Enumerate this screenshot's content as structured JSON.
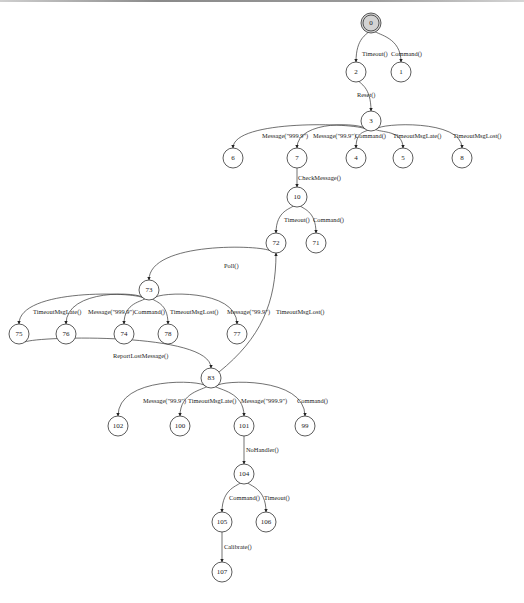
{
  "diagram": {
    "type": "state-transition-tree",
    "nodes": [
      {
        "id": "0",
        "x": 371,
        "y": 23,
        "start": true
      },
      {
        "id": "2",
        "x": 356,
        "y": 72
      },
      {
        "id": "1",
        "x": 401,
        "y": 72
      },
      {
        "id": "3",
        "x": 371,
        "y": 121
      },
      {
        "id": "6",
        "x": 233,
        "y": 158
      },
      {
        "id": "7",
        "x": 297,
        "y": 158
      },
      {
        "id": "4",
        "x": 356,
        "y": 158
      },
      {
        "id": "5",
        "x": 403,
        "y": 158
      },
      {
        "id": "8",
        "x": 462,
        "y": 158
      },
      {
        "id": "10",
        "x": 297,
        "y": 197
      },
      {
        "id": "72",
        "x": 276,
        "y": 243
      },
      {
        "id": "71",
        "x": 316,
        "y": 243
      },
      {
        "id": "73",
        "x": 149,
        "y": 290
      },
      {
        "id": "75",
        "x": 19,
        "y": 334
      },
      {
        "id": "76",
        "x": 66,
        "y": 334
      },
      {
        "id": "74",
        "x": 124,
        "y": 334
      },
      {
        "id": "78",
        "x": 168,
        "y": 334
      },
      {
        "id": "77",
        "x": 237,
        "y": 334
      },
      {
        "id": "83",
        "x": 211,
        "y": 378
      },
      {
        "id": "102",
        "x": 118,
        "y": 426
      },
      {
        "id": "100",
        "x": 180,
        "y": 426
      },
      {
        "id": "101",
        "x": 244,
        "y": 426
      },
      {
        "id": "99",
        "x": 305,
        "y": 426
      },
      {
        "id": "104",
        "x": 244,
        "y": 474
      },
      {
        "id": "105",
        "x": 222,
        "y": 522
      },
      {
        "id": "106",
        "x": 266,
        "y": 522
      },
      {
        "id": "107",
        "x": 222,
        "y": 572
      }
    ],
    "edges": [
      {
        "from": "0",
        "to": "2",
        "label": "Timeout()",
        "lx": 362,
        "ly": 56
      },
      {
        "from": "0",
        "to": "1",
        "label": "Command()",
        "lx": 391,
        "ly": 56
      },
      {
        "from": "2",
        "to": "3",
        "label": "Reset()",
        "lx": 357,
        "ly": 97
      },
      {
        "from": "3",
        "to": "6",
        "label": "Message(\"999.9\")",
        "lx": 262,
        "ly": 138
      },
      {
        "from": "3",
        "to": "7",
        "label": "Message(\"99.9\")",
        "lx": 313,
        "ly": 138
      },
      {
        "from": "3",
        "to": "4",
        "label": "Command()",
        "lx": 355,
        "ly": 138
      },
      {
        "from": "3",
        "to": "5",
        "label": "TimeoutMsgLate()",
        "lx": 393,
        "ly": 138
      },
      {
        "from": "3",
        "to": "8",
        "label": "TimeoutMsgLost()",
        "lx": 453,
        "ly": 138
      },
      {
        "from": "7",
        "to": "10",
        "label": "CheckMessage()",
        "lx": 298,
        "ly": 180
      },
      {
        "from": "10",
        "to": "72",
        "label": "Timeout()",
        "lx": 284,
        "ly": 222
      },
      {
        "from": "10",
        "to": "71",
        "label": "Command()",
        "lx": 313,
        "ly": 222
      },
      {
        "from": "72",
        "to": "73",
        "label": "Poll()",
        "lx": 224,
        "ly": 268
      },
      {
        "from": "73",
        "to": "75",
        "label": "TimeoutMsgLate()",
        "lx": 33,
        "ly": 314
      },
      {
        "from": "73",
        "to": "76",
        "label": "Message(\"999.9\")",
        "lx": 88,
        "ly": 314
      },
      {
        "from": "73",
        "to": "74",
        "label": "Command()",
        "lx": 134,
        "ly": 314
      },
      {
        "from": "73",
        "to": "78",
        "label": "TimeoutMsgLost()",
        "lx": 170,
        "ly": 314
      },
      {
        "from": "73",
        "to": "77",
        "label": "Message(\"99.9\")",
        "lx": 227,
        "ly": 314
      },
      {
        "from": "83",
        "to": "72",
        "label": "TimeoutMsgLost()",
        "lx": 276,
        "ly": 314
      },
      {
        "from": "75",
        "to": "83",
        "label": "ReportLostMessage()",
        "lx": 113,
        "ly": 358
      },
      {
        "from": "83",
        "to": "102",
        "label": "Message(\"99.9\")",
        "lx": 143,
        "ly": 403
      },
      {
        "from": "83",
        "to": "100",
        "label": "TimeoutMsgLate()",
        "lx": 188,
        "ly": 403
      },
      {
        "from": "83",
        "to": "101",
        "label": "Message(\"999.9\")",
        "lx": 241,
        "ly": 403
      },
      {
        "from": "83",
        "to": "99",
        "label": "Command()",
        "lx": 297,
        "ly": 403
      },
      {
        "from": "101",
        "to": "104",
        "label": "NoHandler()",
        "lx": 246,
        "ly": 452
      },
      {
        "from": "104",
        "to": "105",
        "label": "Command()",
        "lx": 229,
        "ly": 500
      },
      {
        "from": "104",
        "to": "106",
        "label": "Timeout()",
        "lx": 264,
        "ly": 500
      },
      {
        "from": "105",
        "to": "107",
        "label": "Calibrate()",
        "lx": 224,
        "ly": 549
      }
    ]
  },
  "caption": "Figure: state transition graph (caption partially cut off)"
}
